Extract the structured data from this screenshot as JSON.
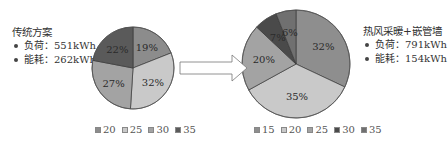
{
  "left_panel": {
    "title": "传统方案",
    "items": [
      {
        "label": "负荷：551kWh"
      },
      {
        "label": "能耗：262kWh"
      }
    ]
  },
  "right_panel": {
    "title": "热风采暖+嵌管墙",
    "items": [
      {
        "label": "负荷：791kWh"
      },
      {
        "label": "能耗：154kWh"
      }
    ]
  },
  "chart_data": [
    {
      "type": "pie",
      "title": "传统方案",
      "categories": [
        "20",
        "25",
        "30",
        "35"
      ],
      "values": [
        19,
        32,
        27,
        22
      ],
      "labels": [
        "19%",
        "32%",
        "27%",
        "22%"
      ],
      "colors": [
        "#8c8c8c",
        "#c9c9c9",
        "#a3a3a3",
        "#5a5a5a"
      ],
      "legend_position": "bottom",
      "start_angle": "top, clockwise"
    },
    {
      "type": "pie",
      "title": "热风采暖+嵌管墙",
      "categories": [
        "15",
        "20",
        "25",
        "30",
        "35"
      ],
      "values": [
        32,
        35,
        20,
        7,
        6
      ],
      "labels": [
        "32%",
        "35%",
        "20%",
        "7%",
        "6%"
      ],
      "colors": [
        "#8e8e8e",
        "#c9c9c9",
        "#a3a3a3",
        "#4a4a4a",
        "#707070"
      ],
      "legend_position": "bottom",
      "start_angle": "top, clockwise"
    }
  ],
  "arrow": {
    "direction": "right"
  }
}
